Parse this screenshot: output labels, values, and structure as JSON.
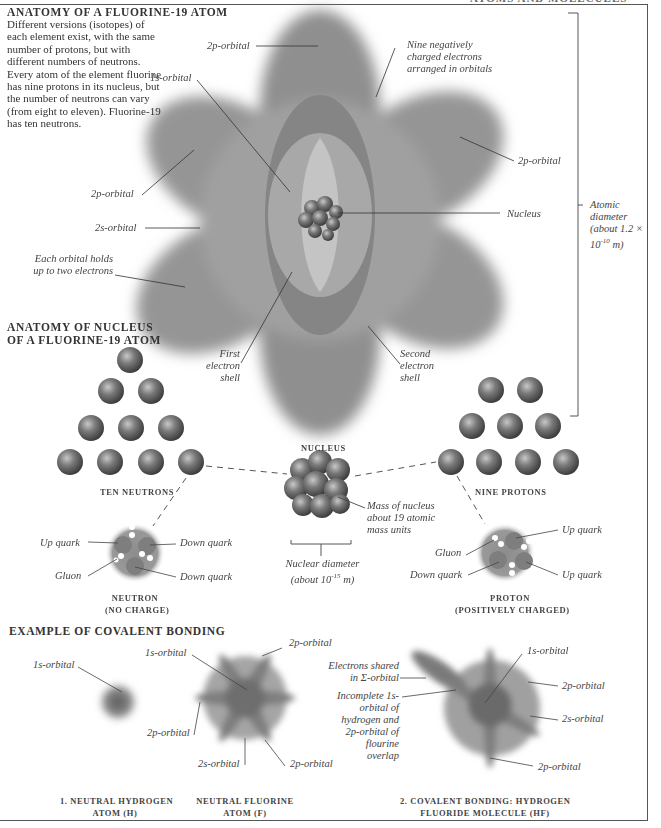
{
  "page": {
    "running_head": "ATOMS AND MOLECULES",
    "colors": {
      "orbital_gray": "#8a8a8a",
      "sphere": "#707070",
      "text": "#333333",
      "frame": "#555555"
    }
  },
  "atom_section": {
    "title": "ANATOMY OF A FLUORINE-19 ATOM",
    "intro": "Different versions (isotopes) of each element exist, with the same number of protons, but with different numbers of neutrons. Every atom of the element fluorine has nine protons in its nucleus, but the number of neutrons can vary (from eight to eleven). Fluorine-19 has ten neutrons.",
    "labels": {
      "top_2p": "2p-orbital",
      "nine_electrons": "Nine negatively charged electrons arranged in orbitals",
      "orbital_1s": "1s-orbital",
      "right_2p": "2p-orbital",
      "left_2p": "2p-orbital",
      "orbital_2s": "2s-orbital",
      "nucleus": "Nucleus",
      "each_orbital": "Each orbital holds up to two electrons",
      "first_shell": "First electron shell",
      "second_shell": "Second electron shell",
      "atomic_diameter": "Atomic diameter (about 1.2 × 10",
      "atomic_diameter_exp": "-10",
      "atomic_diameter_unit": " m)"
    }
  },
  "nucleus_section": {
    "title_line1": "ANATOMY OF NUCLEUS",
    "title_line2": "OF A FLUORINE-19 ATOM",
    "neutrons_caption": "TEN NEUTRONS",
    "protons_caption": "NINE PROTONS",
    "nucleus_caption": "NUCLEUS",
    "mass_label": "Mass of nucleus about 19 atomic mass units",
    "nuclear_diameter": "Nuclear diameter",
    "nuclear_diameter_value": "(about 10",
    "nuclear_diameter_exp": "-15",
    "nuclear_diameter_unit": " m)",
    "neutron": {
      "caption_line1": "NEUTRON",
      "caption_line2": "(NO CHARGE)",
      "labels": {
        "up_quark": "Up quark",
        "down_quark_1": "Down quark",
        "gluon": "Gluon",
        "down_quark_2": "Down quark"
      }
    },
    "proton": {
      "caption_line1": "PROTON",
      "caption_line2": "(POSITIVELY CHARGED)",
      "labels": {
        "up_quark_1": "Up quark",
        "gluon": "Gluon",
        "down_quark": "Down quark",
        "up_quark_2": "Up quark"
      }
    }
  },
  "bonding_section": {
    "title": "EXAMPLE OF COVALENT BONDING",
    "hydrogen": {
      "label_1s": "1s-orbital",
      "caption_line1": "1. NEUTRAL HYDROGEN",
      "caption_line2": "ATOM (H)"
    },
    "fluorine": {
      "label_1s": "1s-orbital",
      "label_2p_top": "2p-orbital",
      "label_2p_left": "2p-orbital",
      "label_2s": "2s-orbital",
      "label_2p_bottom": "2p-orbital",
      "caption_line1": "NEUTRAL FLUORINE",
      "caption_line2": "ATOM (F)"
    },
    "molecule": {
      "label_shared": "Electrons shared in Σ-orbital",
      "label_incomplete": "Incomplete 1s-orbital of hydrogen and 2p-orbital of flourine overlap",
      "label_1s": "1s-orbital",
      "label_2p_top": "2p-orbital",
      "label_2s": "2s-orbital",
      "label_2p_bottom": "2p-orbital",
      "caption_line1": "2. COVALENT BONDING: HYDROGEN",
      "caption_line2": "FLUORIDE MOLECULE (HF)"
    }
  }
}
